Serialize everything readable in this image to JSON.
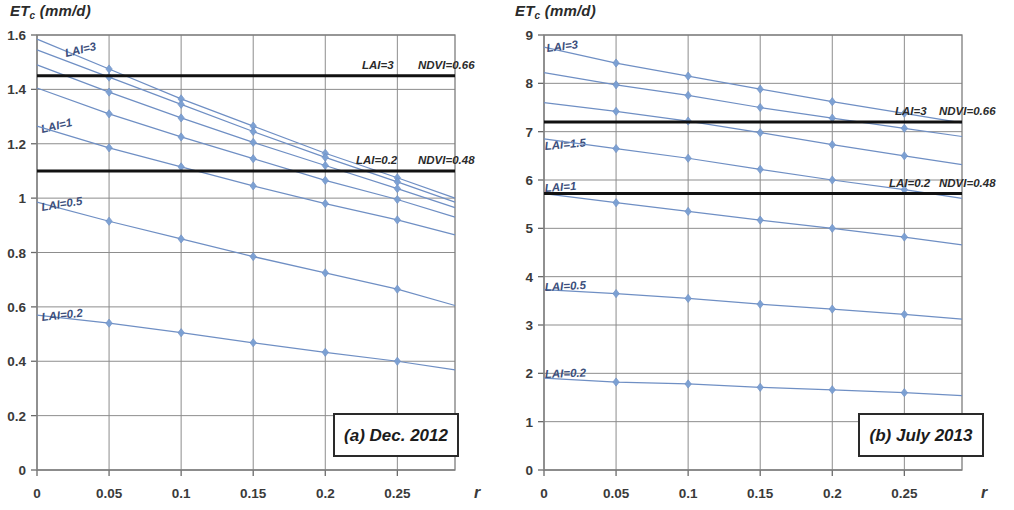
{
  "figure": {
    "panels": [
      {
        "id": "panel-a",
        "caption": "(a) Dec. 2012",
        "y_axis_title": "ET",
        "y_axis_title_sub": "c",
        "y_axis_title_unit": " (mm/d)",
        "x_axis_label": "r"
      },
      {
        "id": "panel-b",
        "caption": "(b) July 2013",
        "y_axis_title": "ET",
        "y_axis_title_sub": "c",
        "y_axis_title_unit": " (mm/d)",
        "x_axis_label": "r"
      }
    ]
  },
  "chart_data": [
    {
      "type": "line",
      "title": "(a) Dec. 2012",
      "xlabel": "r",
      "ylabel": "ETc (mm/d)",
      "xlim": [
        0,
        0.29
      ],
      "ylim": [
        0,
        1.6
      ],
      "xticks": [
        "0",
        "0.05",
        "0.1",
        "0.15",
        "0.2",
        "0.25"
      ],
      "xtick_values": [
        0,
        0.05,
        0.1,
        0.15,
        0.2,
        0.25
      ],
      "yticks": [
        "0",
        "0.2",
        "0.4",
        "0.6",
        "0.8",
        "1",
        "1.2",
        "1.4",
        "1.6"
      ],
      "ytick_values": [
        0,
        0.2,
        0.4,
        0.6,
        0.8,
        1.0,
        1.2,
        1.4,
        1.6
      ],
      "grid": true,
      "legend": "inline-labels",
      "x": [
        0,
        0.05,
        0.1,
        0.15,
        0.2,
        0.25,
        0.29
      ],
      "series": [
        {
          "name": "LAI=3",
          "label": "LAI=3",
          "color": "#6f8fc4",
          "values": [
            1.585,
            1.475,
            1.365,
            1.265,
            1.165,
            1.075,
            1.0
          ]
        },
        {
          "name": "LAI=2",
          "label": "",
          "color": "#6f8fc4",
          "values": [
            1.545,
            1.445,
            1.345,
            1.245,
            1.15,
            1.06,
            0.985
          ]
        },
        {
          "name": "LAI=1.5",
          "label": "",
          "color": "#6f8fc4",
          "values": [
            1.49,
            1.39,
            1.295,
            1.205,
            1.12,
            1.035,
            0.965
          ]
        },
        {
          "name": "LAI=1",
          "label": "LAI=1",
          "color": "#6f8fc4",
          "values": [
            1.405,
            1.31,
            1.225,
            1.145,
            1.065,
            0.995,
            0.93
          ]
        },
        {
          "name": "LAI=0.7",
          "label": "",
          "color": "#6f8fc4",
          "values": [
            1.265,
            1.185,
            1.115,
            1.045,
            0.98,
            0.92,
            0.865
          ]
        },
        {
          "name": "LAI=0.5",
          "label": "LAI=0.5",
          "color": "#6f8fc4",
          "values": [
            0.985,
            0.915,
            0.85,
            0.785,
            0.725,
            0.665,
            0.605
          ]
        },
        {
          "name": "LAI=0.2",
          "label": "LAI=0.2",
          "color": "#6f8fc4",
          "values": [
            0.57,
            0.54,
            0.505,
            0.468,
            0.433,
            0.4,
            0.368
          ]
        }
      ],
      "reference_lines": [
        {
          "value": 1.45,
          "label_left": "LAI=3",
          "label_right": "NDVI=0.66",
          "color": "#111111"
        },
        {
          "value": 1.1,
          "label_left": "LAI=0.2",
          "label_right": "NDVI=0.48",
          "color": "#111111"
        }
      ]
    },
    {
      "type": "line",
      "title": "(b) July 2013",
      "xlabel": "r",
      "ylabel": "ETc (mm/d)",
      "xlim": [
        0,
        0.29
      ],
      "ylim": [
        0,
        9
      ],
      "xticks": [
        "0",
        "0.05",
        "0.1",
        "0.15",
        "0.2",
        "0.25"
      ],
      "xtick_values": [
        0,
        0.05,
        0.1,
        0.15,
        0.2,
        0.25
      ],
      "yticks": [
        "0",
        "1",
        "2",
        "3",
        "4",
        "5",
        "6",
        "7",
        "8",
        "9"
      ],
      "ytick_values": [
        0,
        1,
        2,
        3,
        4,
        5,
        6,
        7,
        8,
        9
      ],
      "grid": true,
      "legend": "inline-labels",
      "x": [
        0,
        0.05,
        0.1,
        0.15,
        0.2,
        0.25,
        0.29
      ],
      "series": [
        {
          "name": "LAI=3",
          "label": "LAI=3",
          "color": "#6f8fc4",
          "values": [
            8.75,
            8.42,
            8.15,
            7.88,
            7.62,
            7.38,
            7.18
          ]
        },
        {
          "name": "LAI=2",
          "label": "",
          "color": "#6f8fc4",
          "values": [
            8.22,
            7.97,
            7.75,
            7.5,
            7.28,
            7.07,
            6.9
          ]
        },
        {
          "name": "LAI=1.5",
          "label": "LAI=1.5",
          "color": "#6f8fc4",
          "values": [
            7.6,
            7.42,
            7.22,
            6.98,
            6.73,
            6.5,
            6.32
          ]
        },
        {
          "name": "LAI=1",
          "label": "LAI=1",
          "color": "#6f8fc4",
          "values": [
            6.85,
            6.65,
            6.45,
            6.22,
            6.0,
            5.8,
            5.62
          ]
        },
        {
          "name": "LAI=0.7",
          "label": "",
          "color": "#6f8fc4",
          "values": [
            5.72,
            5.53,
            5.35,
            5.17,
            5.0,
            4.82,
            4.66
          ]
        },
        {
          "name": "LAI=0.5",
          "label": "LAI=0.5",
          "color": "#6f8fc4",
          "values": [
            3.73,
            3.65,
            3.55,
            3.43,
            3.33,
            3.22,
            3.12
          ]
        },
        {
          "name": "LAI=0.2",
          "label": "LAI=0.2",
          "color": "#6f8fc4",
          "values": [
            1.9,
            1.82,
            1.78,
            1.71,
            1.66,
            1.6,
            1.54
          ]
        }
      ],
      "reference_lines": [
        {
          "value": 7.2,
          "label_left": "LAI=3",
          "label_right": "NDVI=0.66",
          "color": "#111111"
        },
        {
          "value": 5.72,
          "label_left": "LAI=0.2",
          "label_right": "NDVI=0.48",
          "color": "#111111"
        }
      ]
    }
  ]
}
